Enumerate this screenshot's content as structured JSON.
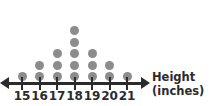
{
  "chart_data": {
    "type": "dotplot",
    "title": "",
    "xlabel": "Height",
    "xlabel_unit": "(inches)",
    "ylabel": "",
    "categories": [
      15,
      16,
      17,
      18,
      19,
      20,
      21
    ],
    "tick_labels": [
      "15",
      "16",
      "17",
      "18",
      "19",
      "20",
      "21"
    ],
    "values": [
      1,
      2,
      3,
      5,
      3,
      2,
      1
    ],
    "total_dots": 17,
    "dot_unit": 1,
    "xlim": [
      15,
      21
    ],
    "grid": false,
    "legend": null,
    "axis_style": "double-headed-arrow",
    "colors": {
      "dot": "#8c8c8c",
      "axis": "#2b2b2b",
      "text": "#2b2b2b",
      "background": "#ffffff"
    }
  },
  "axis": {
    "title_line1": "Height",
    "title_line2": "(inches)"
  }
}
